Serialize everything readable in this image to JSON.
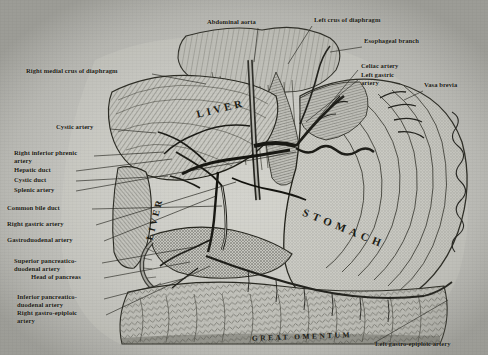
{
  "figure": {
    "organ_labels": [
      {
        "text": "LIVER",
        "x": 196,
        "y": 103,
        "rot": -14,
        "size": 10.5,
        "spacing": 3.2
      },
      {
        "text": "LIVER",
        "x": 133,
        "y": 214,
        "rot": -76,
        "size": 9.5,
        "spacing": 2.6
      },
      {
        "text": "STOMACH",
        "x": 330,
        "y": 222,
        "rot": 22,
        "size": 11,
        "spacing": 4.5
      },
      {
        "text": "GREAT OMENTUM",
        "x": 312,
        "y": 334,
        "rot": -2,
        "size": 7.5,
        "spacing": 2.4
      }
    ],
    "callouts": [
      {
        "name": "abdominal-aorta",
        "text": "Abdominal aorta",
        "x": 207,
        "y": 22,
        "align": "left"
      },
      {
        "name": "left-crus-of-diaphragm",
        "text": "Left crus of diaphragm",
        "x": 314,
        "y": 20,
        "align": "left"
      },
      {
        "name": "esophageal-branch",
        "text": "Esophageal branch",
        "x": 364,
        "y": 41,
        "align": "left"
      },
      {
        "name": "right-medial-crus-of-diaphragm",
        "text": "Right medial crus of diaphragm",
        "x": 26,
        "y": 71,
        "align": "left"
      },
      {
        "name": "celiac-artery",
        "text": "Celiac artery",
        "x": 361,
        "y": 66,
        "align": "left"
      },
      {
        "name": "left-gastric-artery",
        "text": "Left gastric\nartery",
        "x": 361,
        "y": 75,
        "align": "left"
      },
      {
        "name": "vasa-brevia",
        "text": "Vasa brevia",
        "x": 424,
        "y": 85,
        "align": "left"
      },
      {
        "name": "cystic-artery",
        "text": "Cystic artery",
        "x": 56,
        "y": 127,
        "align": "left"
      },
      {
        "name": "right-inferior-phrenic-artery",
        "text": "Right inferior phrenic\nartery",
        "x": 14,
        "y": 153,
        "align": "left"
      },
      {
        "name": "hepatic-duct",
        "text": "Hepatic duct",
        "x": 14,
        "y": 170,
        "align": "left"
      },
      {
        "name": "cystic-duct",
        "text": "Cystic duct",
        "x": 14,
        "y": 180,
        "align": "left"
      },
      {
        "name": "splenic-artery",
        "text": "Splenic artery",
        "x": 14,
        "y": 190,
        "align": "left"
      },
      {
        "name": "common-bile-duct",
        "text": "Common bile duct",
        "x": 7,
        "y": 208,
        "align": "left"
      },
      {
        "name": "right-gastric-artery",
        "text": "Right gastric artery",
        "x": 7,
        "y": 224,
        "align": "left"
      },
      {
        "name": "gastroduodenal-artery",
        "text": "Gastroduodenal artery",
        "x": 7,
        "y": 240,
        "align": "left"
      },
      {
        "name": "superior-pancreaticoduodenal-artery",
        "text": "Superior pancreatico-\nduodenal artery",
        "x": 14,
        "y": 261,
        "align": "left"
      },
      {
        "name": "head-of-pancreas",
        "text": "Head of pancreas",
        "x": 31,
        "y": 277,
        "align": "left"
      },
      {
        "name": "inferior-pancreaticoduodenal-artery",
        "text": "Inferior pancreatico-\nduodenal artery",
        "x": 17,
        "y": 297,
        "align": "left"
      },
      {
        "name": "right-gastro-epiploic-artery",
        "text": "Right gastro-epiploic\nartery",
        "x": 17,
        "y": 313,
        "align": "left"
      },
      {
        "name": "left-gastro-epiploic-artery",
        "text": "Left gastro-epiploic artery",
        "x": 375,
        "y": 344,
        "align": "left"
      }
    ],
    "colors": {
      "ink": "#17170f",
      "paper_light": "#d7d7d2",
      "paper_dark": "#b9b9b4"
    }
  }
}
